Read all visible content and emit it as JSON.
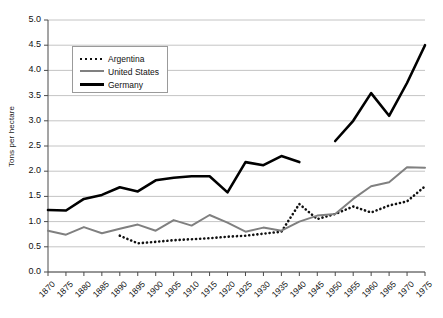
{
  "chart_data": {
    "type": "line",
    "title": "",
    "xlabel": "",
    "ylabel": "Tons per hectare",
    "ylim": [
      0.0,
      5.0
    ],
    "ytick_step": 0.5,
    "xlim": [
      1870,
      1975
    ],
    "grid": "horizontal",
    "legend_position": "top-left-inside",
    "x": [
      1870,
      1875,
      1880,
      1885,
      1890,
      1895,
      1900,
      1905,
      1910,
      1915,
      1920,
      1925,
      1930,
      1935,
      1940,
      1945,
      1950,
      1955,
      1960,
      1965,
      1970,
      1975
    ],
    "yticks": [
      "0.0",
      "0.5",
      "1.0",
      "1.5",
      "2.0",
      "2.5",
      "3.0",
      "3.5",
      "4.0",
      "4.5",
      "5.0"
    ],
    "xticks": [
      "1870",
      "1875",
      "1880",
      "1885",
      "1890",
      "1895",
      "1900",
      "1905",
      "1910",
      "1915",
      "1920",
      "1925",
      "1930",
      "1935",
      "1940",
      "1945",
      "1950",
      "1955",
      "1960",
      "1965",
      "1970",
      "1975"
    ],
    "series": [
      {
        "name": "Argentina",
        "style": "dotted",
        "color": "#111111",
        "values": [
          null,
          null,
          null,
          null,
          0.72,
          0.57,
          0.6,
          0.63,
          0.65,
          0.67,
          0.7,
          0.72,
          0.76,
          0.8,
          1.35,
          1.05,
          1.15,
          1.3,
          1.18,
          1.32,
          1.4,
          1.7
        ]
      },
      {
        "name": "United States",
        "style": "solid-gray",
        "color": "#808080",
        "values": [
          0.82,
          0.74,
          0.89,
          0.77,
          0.86,
          0.94,
          0.82,
          1.03,
          0.92,
          1.13,
          0.98,
          0.8,
          0.88,
          0.82,
          1.0,
          1.12,
          1.15,
          1.45,
          1.7,
          1.78,
          2.08,
          2.07
        ]
      },
      {
        "name": "Germany",
        "style": "solid-bold",
        "color": "#000000",
        "values": [
          1.23,
          1.22,
          1.45,
          1.53,
          1.68,
          1.6,
          1.82,
          1.87,
          1.9,
          1.9,
          1.58,
          2.18,
          2.12,
          2.3,
          2.18,
          null,
          2.6,
          3.0,
          3.55,
          3.1,
          3.75,
          4.5
        ]
      }
    ]
  },
  "legend": {
    "items": [
      {
        "label": "Argentina"
      },
      {
        "label": "United States"
      },
      {
        "label": "Germany"
      }
    ]
  }
}
